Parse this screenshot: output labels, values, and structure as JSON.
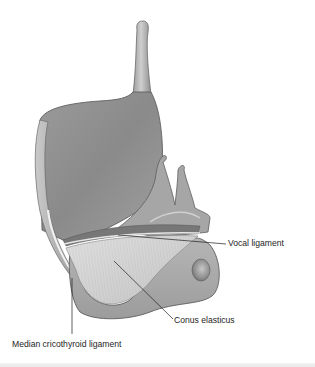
{
  "figure": {
    "colors": {
      "background": "#ffffff",
      "cartilage_light": "#d8d8d8",
      "cartilage_mid": "#a9a9a9",
      "cartilage_dark": "#7a7a7a",
      "outline": "#5e5e5e",
      "leader_line": "#1e1e1e",
      "label_text": "#1e1e1e"
    }
  },
  "labels": [
    {
      "id": "vocal-ligament",
      "text": "Vocal ligament"
    },
    {
      "id": "conus-elasticus",
      "text": "Conus elasticus"
    },
    {
      "id": "median-cricothyroid-ligament",
      "text": "Median cricothyroid ligament"
    }
  ]
}
